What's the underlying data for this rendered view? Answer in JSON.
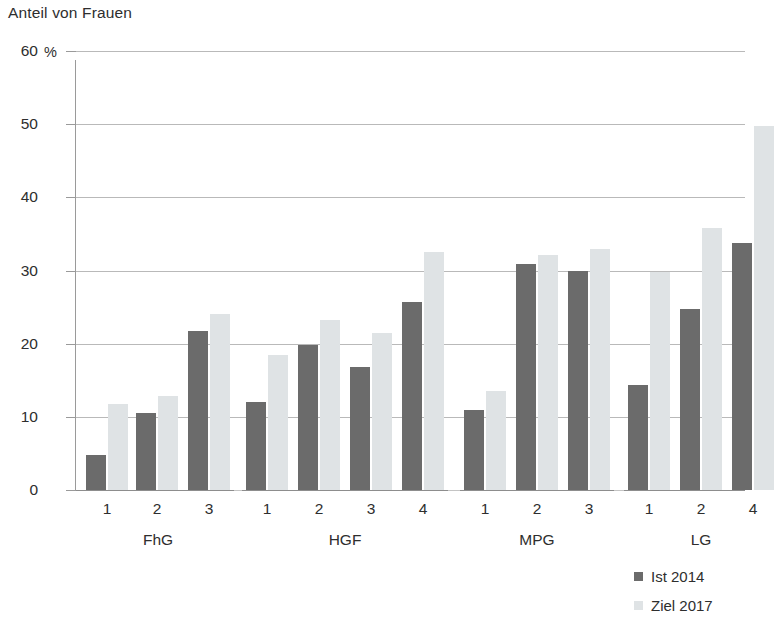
{
  "chart_data": {
    "type": "bar",
    "title": "Anteil von Frauen",
    "xlabel": "",
    "ylabel": "%",
    "unit_label": "%",
    "ylim": [
      0,
      60
    ],
    "ytick_values": [
      60,
      50,
      40,
      30,
      20,
      10,
      0
    ],
    "ytick_labels": [
      "60",
      "50",
      "40",
      "30",
      "20",
      "10",
      "0"
    ],
    "grid": true,
    "legend_position": "bottom-right",
    "groups": [
      {
        "name": "FhG",
        "categories": [
          "1",
          "2",
          "3"
        ]
      },
      {
        "name": "HGF",
        "categories": [
          "1",
          "2",
          "3",
          "4"
        ]
      },
      {
        "name": "MPG",
        "categories": [
          "1",
          "2",
          "3"
        ]
      },
      {
        "name": "LG",
        "categories": [
          "1",
          "2",
          "4"
        ]
      }
    ],
    "categories": [
      "FhG 1",
      "FhG 2",
      "FhG 3",
      "HGF 1",
      "HGF 2",
      "HGF 3",
      "HGF 4",
      "MPG 1",
      "MPG 2",
      "MPG 3",
      "LG 1",
      "LG 2",
      "LG 4"
    ],
    "series": [
      {
        "name": "Ist 2014",
        "color": "#6b6b6b",
        "values": [
          4.8,
          10.5,
          21.7,
          12.0,
          19.8,
          16.8,
          25.7,
          10.9,
          30.9,
          30.0,
          14.3,
          24.7,
          33.7
        ]
      },
      {
        "name": "Ziel 2017",
        "color": "#dfe3e5",
        "values": [
          11.7,
          12.8,
          24.0,
          18.4,
          23.2,
          21.5,
          32.5,
          13.5,
          32.1,
          33.0,
          29.8,
          35.8,
          49.7
        ]
      }
    ]
  },
  "legend": {
    "items": [
      {
        "label": "Ist 2014",
        "color": "#6b6b6b"
      },
      {
        "label": "Ziel 2017",
        "color": "#dfe3e5"
      }
    ]
  }
}
